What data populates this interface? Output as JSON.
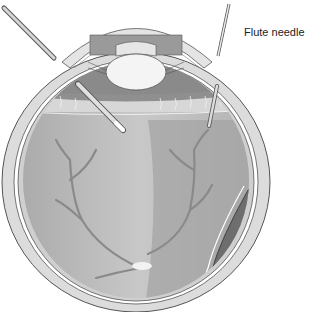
{
  "diagram": {
    "labels": [
      {
        "id": "flute-needle",
        "text": "Flute needle",
        "x": 244,
        "y": 26
      }
    ],
    "colors": {
      "sclera": "#d8d8d8",
      "outline": "#555555",
      "vitreous_light": "#bdbdbd",
      "vitreous_mid": "#a5a5a5",
      "detachment_dark": "#6e6e6e",
      "vessels": "#8a8a8a",
      "lens": "#f2f2f2",
      "iris": "#9a9a9a",
      "background": "#ffffff"
    }
  }
}
